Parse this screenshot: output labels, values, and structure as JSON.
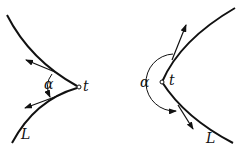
{
  "figures": [
    {
      "id": "cusp",
      "labels": {
        "angle": "α",
        "point": "t",
        "curve": "L"
      }
    },
    {
      "id": "corner",
      "labels": {
        "angle": "α",
        "point": "t",
        "curve": "L"
      }
    }
  ],
  "colors": {
    "stroke": "#111111",
    "background": "#ffffff"
  }
}
